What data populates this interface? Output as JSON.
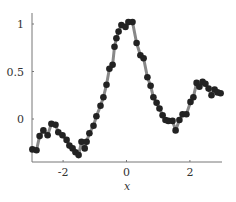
{
  "chart_data": {
    "type": "scatter",
    "title": "",
    "xlabel": "x",
    "ylabel": "",
    "xlim": [
      -3,
      3
    ],
    "ylim": [
      -0.45,
      1.1
    ],
    "grid": false,
    "legend": null,
    "x_ticks": [
      -2,
      0,
      2
    ],
    "x_tick_labels": [
      "-2",
      "0",
      "2"
    ],
    "y_ticks": [
      0,
      0.5,
      1
    ],
    "y_tick_labels": [
      "0",
      "0.5",
      "1"
    ],
    "series": [
      {
        "name": "samples",
        "style": "markers + connecting line",
        "marker_color": "#222222",
        "line_color": "#888888",
        "x": [
          -2.97,
          -2.84,
          -2.74,
          -2.62,
          -2.49,
          -2.37,
          -2.24,
          -2.15,
          -2.02,
          -1.89,
          -1.8,
          -1.7,
          -1.61,
          -1.51,
          -1.42,
          -1.32,
          -1.26,
          -1.17,
          -1.04,
          -0.95,
          -0.82,
          -0.73,
          -0.63,
          -0.54,
          -0.44,
          -0.38,
          -0.32,
          -0.25,
          -0.16,
          -0.03,
          0.06,
          0.19,
          0.32,
          0.44,
          0.54,
          0.66,
          0.76,
          0.85,
          0.95,
          1.04,
          1.14,
          1.23,
          1.32,
          1.45,
          1.55,
          1.67,
          1.77,
          1.89,
          2.02,
          2.11,
          2.21,
          2.3,
          2.4,
          2.49,
          2.59,
          2.68,
          2.78,
          2.87,
          2.97
        ],
        "y": [
          -0.32,
          -0.33,
          -0.18,
          -0.12,
          -0.17,
          -0.05,
          -0.06,
          -0.14,
          -0.17,
          -0.22,
          -0.28,
          -0.31,
          -0.35,
          -0.38,
          -0.24,
          -0.31,
          -0.24,
          -0.15,
          -0.07,
          0.03,
          0.14,
          0.23,
          0.36,
          0.53,
          0.57,
          0.76,
          0.85,
          0.92,
          0.99,
          0.97,
          1.02,
          1.02,
          0.8,
          0.67,
          0.64,
          0.44,
          0.35,
          0.23,
          0.17,
          0.11,
          0.04,
          -0.01,
          -0.02,
          -0.02,
          -0.12,
          -0.01,
          0.05,
          0.05,
          0.18,
          0.23,
          0.38,
          0.34,
          0.39,
          0.37,
          0.32,
          0.25,
          0.31,
          0.28,
          0.27
        ]
      }
    ]
  },
  "layout": {
    "plot_left": 32,
    "plot_right": 222,
    "plot_top": 13,
    "plot_bottom": 162,
    "x_px_zero": 126.5,
    "x_px_per_unit": 31.7,
    "y_px_zero": 119,
    "y_px_per_unit": 95
  }
}
